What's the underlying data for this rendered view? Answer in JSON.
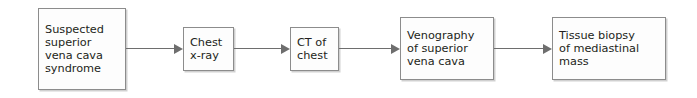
{
  "diagram": {
    "orientation": "left-to-right",
    "colors": {
      "background": "#ffffff",
      "box_fill": "#fdfdfd",
      "box_border": "#8c8c8c",
      "text": "#231f20",
      "arrow": "#6e6e6e"
    },
    "nodes": [
      {
        "id": "node-0",
        "name": "suspected-svc-syndrome",
        "text": "Suspected superior vena cava syndrome",
        "lines": [
          "Suspected",
          "superior",
          "vena cava",
          "syndrome"
        ]
      },
      {
        "id": "node-1",
        "name": "chest-x-ray",
        "text": "Chest x-ray",
        "lines": [
          "Chest",
          "x-ray"
        ]
      },
      {
        "id": "node-2",
        "name": "ct-of-chest",
        "text": "CT of chest",
        "lines": [
          "CT of",
          "chest"
        ]
      },
      {
        "id": "node-3",
        "name": "venography-of-superior-vena-cava",
        "text": "Venography of superior vena cava",
        "lines": [
          "Venography",
          "of superior",
          "vena cava"
        ]
      },
      {
        "id": "node-4",
        "name": "tissue-biopsy-of-mediastinal-mass",
        "text": "Tissue biopsy of mediastinal mass",
        "lines": [
          "Tissue biopsy",
          "of mediastinal",
          "mass"
        ]
      }
    ],
    "connectors": [
      {
        "id": "conn-0",
        "name": "arrow-suspected-to-chest-x-ray",
        "from": "node-0",
        "to": "node-1",
        "icon": "arrow-right-icon",
        "label": ""
      },
      {
        "id": "conn-1",
        "name": "arrow-chest-x-ray-to-ct",
        "from": "node-1",
        "to": "node-2",
        "icon": "arrow-right-icon",
        "label": ""
      },
      {
        "id": "conn-2",
        "name": "arrow-ct-to-venography",
        "from": "node-2",
        "to": "node-3",
        "icon": "arrow-right-icon",
        "label": ""
      },
      {
        "id": "conn-3",
        "name": "arrow-venography-to-biopsy",
        "from": "node-3",
        "to": "node-4",
        "icon": "arrow-right-icon",
        "label": ""
      }
    ]
  }
}
